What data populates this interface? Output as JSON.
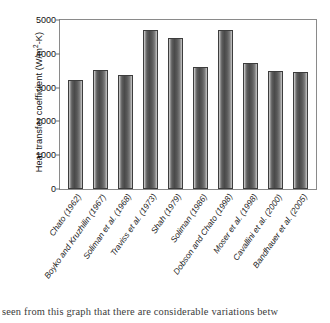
{
  "chart_data": {
    "type": "bar",
    "title": "",
    "xlabel": "",
    "ylabel": "Heat transfer coefficient (W/m2-K)",
    "ylabel_parts": {
      "prefix": "Heat transfer coefficient (W/m",
      "sup": "2",
      "suffix": "-K)"
    },
    "ylim": [
      0,
      5000
    ],
    "yticks": [
      0,
      1000,
      2000,
      3000,
      4000,
      5000
    ],
    "ytick_labels": [
      "0",
      "1000",
      "2000",
      "3000",
      "4000",
      "5000"
    ],
    "grid": false,
    "legend": null,
    "categories": [
      "Chato (1962)",
      "Boyko and Kruzhilin (1967)",
      "Soliman et al. (1968)",
      "Traviss et al. (1973)",
      "Shah (1979)",
      "Soliman (1986)",
      "Dobson and Chato (1998)",
      "Moser et al. (1998)",
      "Cavallini et al. (2000)",
      "Bandhauer et al. (2005)"
    ],
    "values": [
      3230,
      3530,
      3370,
      4700,
      4480,
      3600,
      4710,
      3740,
      3500,
      3460
    ]
  },
  "caption": {
    "text": "seen from this graph that there are considerable variations betw"
  }
}
